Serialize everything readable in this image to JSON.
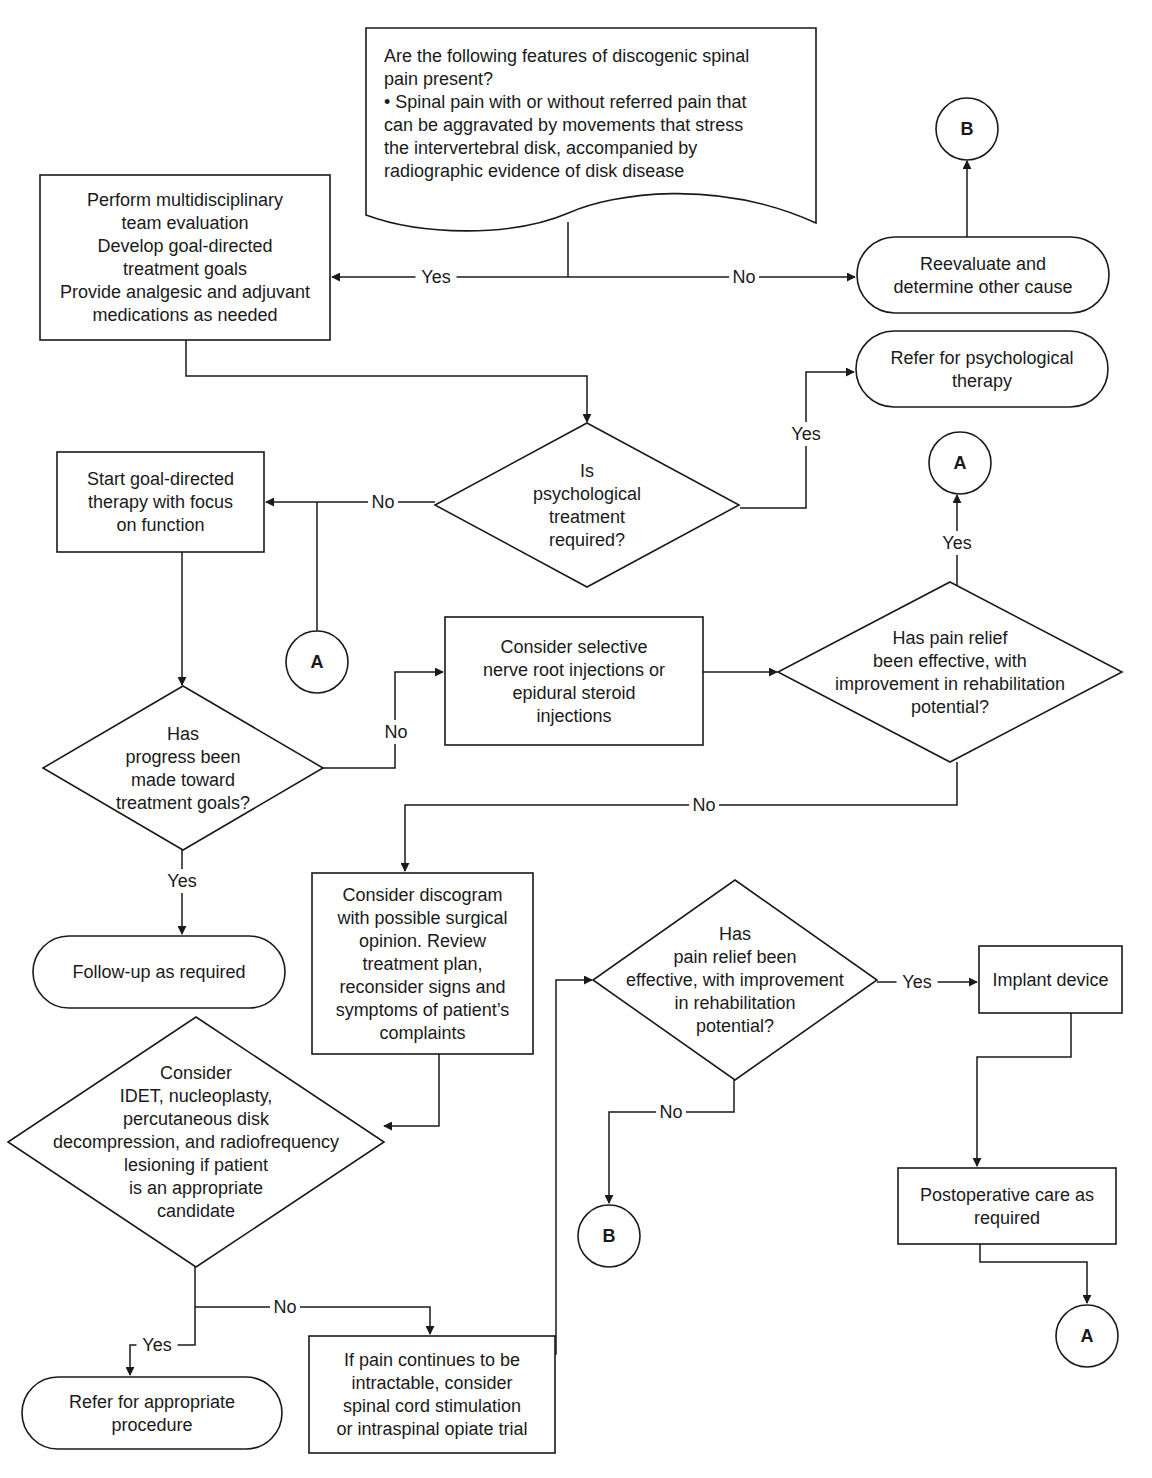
{
  "colors": {
    "line": "#1a1a1a",
    "fill": "#ffffff",
    "text": "#1a1a1a"
  },
  "nodes": [
    {
      "id": "q-discogenic",
      "type": "document",
      "x": 366,
      "y": 28,
      "w": 450,
      "h": 205,
      "align": "left",
      "text_x": 384,
      "text_y": 62,
      "lines": [
        "Are the following features of discogenic spinal",
        "pain present?",
        "• Spinal pain with or without referred pain that",
        "   can be aggravated by movements that stress",
        "   the intervertebral disk, accompanied by",
        "   radiographic evidence of disk disease"
      ]
    },
    {
      "id": "multidisciplinary-eval",
      "type": "rect",
      "x": 40,
      "y": 175,
      "w": 290,
      "h": 165,
      "lines": [
        "Perform multidisciplinary",
        "team evaluation",
        "Develop goal-directed",
        "treatment goals",
        "Provide analgesic and adjuvant",
        "medications as needed"
      ]
    },
    {
      "id": "reevaluate-other-cause",
      "type": "terminal",
      "x": 857,
      "y": 237,
      "w": 252,
      "h": 76,
      "lines": [
        "Reevaluate and",
        "determine other cause"
      ]
    },
    {
      "id": "refer-psych-therapy",
      "type": "terminal",
      "x": 856,
      "y": 331,
      "w": 252,
      "h": 76,
      "lines": [
        "Refer for psychological",
        "therapy"
      ]
    },
    {
      "id": "q-psych-treatment",
      "type": "diamond",
      "cx": 587,
      "cy": 505,
      "hw": 152,
      "hh": 82,
      "lines": [
        "Is",
        "psychological",
        "treatment",
        "required?"
      ]
    },
    {
      "id": "goal-directed-therapy",
      "type": "rect",
      "x": 57,
      "y": 452,
      "w": 207,
      "h": 100,
      "lines": [
        "Start goal-directed",
        "therapy with focus",
        "on function"
      ]
    },
    {
      "id": "q-progress",
      "type": "diamond",
      "cx": 183,
      "cy": 768,
      "hw": 140,
      "hh": 82,
      "lines": [
        "Has",
        "progress been",
        "made toward",
        "treatment goals?"
      ]
    },
    {
      "id": "nerve-root-injections",
      "type": "rect",
      "x": 445,
      "y": 617,
      "w": 258,
      "h": 128,
      "lines": [
        "Consider selective",
        "nerve root injections or",
        "epidural steroid",
        "injections"
      ]
    },
    {
      "id": "q-pain-relief-1",
      "type": "diamond",
      "cx": 950,
      "cy": 672,
      "hw": 172,
      "hh": 90,
      "lines": [
        "Has pain relief",
        "been effective, with",
        "improvement in rehabilitation",
        "potential?"
      ]
    },
    {
      "id": "followup",
      "type": "terminal",
      "x": 33,
      "y": 936,
      "w": 252,
      "h": 72,
      "lines": [
        "Follow-up as required"
      ]
    },
    {
      "id": "discogram",
      "type": "rect",
      "x": 312,
      "y": 873,
      "w": 221,
      "h": 181,
      "lines": [
        "Consider discogram",
        "with possible surgical",
        "opinion. Review",
        "treatment plan,",
        "reconsider signs and",
        "symptoms of patient’s",
        "complaints"
      ]
    },
    {
      "id": "q-idet",
      "type": "diamond",
      "cx": 196,
      "cy": 1142,
      "hw": 188,
      "hh": 125,
      "lines": [
        "Consider",
        "IDET, nucleoplasty,",
        "percutaneous disk",
        "decompression, and radiofrequency",
        "lesioning if patient",
        "is an appropriate",
        "candidate"
      ]
    },
    {
      "id": "q-pain-relief-2",
      "type": "diamond",
      "cx": 735,
      "cy": 980,
      "hw": 142,
      "hh": 100,
      "lines": [
        "Has",
        "pain relief been",
        "effective, with improvement",
        "in rehabilitation",
        "potential?"
      ]
    },
    {
      "id": "implant-device",
      "type": "rect",
      "x": 979,
      "y": 946,
      "w": 143,
      "h": 67,
      "lines": [
        "Implant device"
      ]
    },
    {
      "id": "postop-care",
      "type": "rect",
      "x": 898,
      "y": 1168,
      "w": 218,
      "h": 76,
      "lines": [
        "Postoperative care as",
        "required"
      ]
    },
    {
      "id": "refer-procedure",
      "type": "terminal",
      "x": 22,
      "y": 1377,
      "w": 260,
      "h": 72,
      "lines": [
        "Refer for appropriate",
        "procedure"
      ]
    },
    {
      "id": "scs-trial",
      "type": "rect",
      "x": 309,
      "y": 1336,
      "w": 246,
      "h": 117,
      "lines": [
        "If pain continues to be",
        "intractable, consider",
        "spinal cord stimulation",
        "or intraspinal opiate trial"
      ]
    }
  ],
  "connectors": [
    {
      "id": "connector-b-top",
      "label": "B",
      "cx": 967,
      "cy": 129,
      "r": 31
    },
    {
      "id": "connector-a-right",
      "label": "A",
      "cx": 960,
      "cy": 463,
      "r": 31
    },
    {
      "id": "connector-a-left",
      "label": "A",
      "cx": 317,
      "cy": 662,
      "r": 31
    },
    {
      "id": "connector-b-bottom",
      "label": "B",
      "cx": 609,
      "cy": 1236,
      "r": 31
    },
    {
      "id": "connector-a-bottom",
      "label": "A",
      "cx": 1087,
      "cy": 1336,
      "r": 31
    }
  ],
  "edges": [
    {
      "id": "edge-discogenic-down",
      "points": [
        [
          568,
          222
        ],
        [
          568,
          277
        ]
      ],
      "arrow": false
    },
    {
      "id": "edge-discogenic-yes",
      "points": [
        [
          568,
          277
        ],
        [
          332,
          277
        ]
      ],
      "arrow": true
    },
    {
      "id": "edge-discogenic-no",
      "points": [
        [
          568,
          277
        ],
        [
          855,
          277
        ]
      ],
      "arrow": true
    },
    {
      "id": "edge-reevaluate-to-b",
      "points": [
        [
          967,
          237
        ],
        [
          967,
          161
        ]
      ],
      "arrow": true
    },
    {
      "id": "edge-eval-to-psych",
      "points": [
        [
          186,
          340
        ],
        [
          186,
          376
        ],
        [
          587,
          376
        ],
        [
          587,
          422
        ]
      ],
      "arrow": true
    },
    {
      "id": "edge-psych-yes",
      "points": [
        [
          740,
          508
        ],
        [
          806,
          508
        ],
        [
          806,
          372
        ],
        [
          854,
          372
        ]
      ],
      "arrow": true
    },
    {
      "id": "edge-psych-no",
      "points": [
        [
          435,
          502
        ],
        [
          266,
          502
        ]
      ],
      "arrow": true
    },
    {
      "id": "edge-a-to-therapy",
      "points": [
        [
          317,
          631
        ],
        [
          317,
          502
        ]
      ],
      "arrow": false
    },
    {
      "id": "edge-therapy-to-progress",
      "points": [
        [
          182,
          552
        ],
        [
          182,
          685
        ]
      ],
      "arrow": true
    },
    {
      "id": "edge-progress-no",
      "points": [
        [
          323,
          768
        ],
        [
          395,
          768
        ],
        [
          395,
          672
        ],
        [
          443,
          672
        ]
      ],
      "arrow": true
    },
    {
      "id": "edge-injections-to-relief",
      "points": [
        [
          703,
          672
        ],
        [
          777,
          672
        ]
      ],
      "arrow": true
    },
    {
      "id": "edge-relief1-yes",
      "points": [
        [
          957,
          587
        ],
        [
          957,
          495
        ]
      ],
      "arrow": true
    },
    {
      "id": "edge-relief1-no",
      "points": [
        [
          957,
          762
        ],
        [
          957,
          805
        ],
        [
          405,
          805
        ],
        [
          405,
          871
        ]
      ],
      "arrow": true
    },
    {
      "id": "edge-progress-yes",
      "points": [
        [
          182,
          850
        ],
        [
          182,
          934
        ]
      ],
      "arrow": true
    },
    {
      "id": "edge-discogram-to-idet",
      "points": [
        [
          439,
          1054
        ],
        [
          439,
          1126
        ],
        [
          384,
          1126
        ]
      ],
      "arrow": true
    },
    {
      "id": "edge-idet-down",
      "points": [
        [
          195,
          1267
        ],
        [
          195,
          1307
        ]
      ],
      "arrow": false
    },
    {
      "id": "edge-idet-no",
      "points": [
        [
          195,
          1307
        ],
        [
          430,
          1307
        ],
        [
          430,
          1334
        ]
      ],
      "arrow": true
    },
    {
      "id": "edge-idet-yes",
      "points": [
        [
          195,
          1307
        ],
        [
          195,
          1345
        ],
        [
          130,
          1345
        ],
        [
          130,
          1375
        ]
      ],
      "arrow": true
    },
    {
      "id": "edge-scs-to-relief2",
      "points": [
        [
          555,
          1354
        ],
        [
          556,
          1354
        ],
        [
          556,
          980
        ],
        [
          592,
          980
        ]
      ],
      "arrow": true
    },
    {
      "id": "edge-relief2-yes",
      "points": [
        [
          877,
          982
        ],
        [
          977,
          982
        ]
      ],
      "arrow": true
    },
    {
      "id": "edge-relief2-no",
      "points": [
        [
          734,
          1080
        ],
        [
          734,
          1112
        ],
        [
          609,
          1112
        ],
        [
          609,
          1203
        ]
      ],
      "arrow": true
    },
    {
      "id": "edge-implant-to-postop",
      "points": [
        [
          1071,
          1013
        ],
        [
          1071,
          1057
        ],
        [
          977,
          1057
        ],
        [
          977,
          1166
        ]
      ],
      "arrow": true
    },
    {
      "id": "edge-postop-to-a",
      "points": [
        [
          980,
          1244
        ],
        [
          980,
          1262
        ],
        [
          1087,
          1262
        ],
        [
          1087,
          1303
        ]
      ],
      "arrow": true
    }
  ],
  "edge_labels": [
    {
      "id": "label-discogenic-yes",
      "text": "Yes",
      "x": 436,
      "y": 277
    },
    {
      "id": "label-discogenic-no",
      "text": "No",
      "x": 744,
      "y": 277
    },
    {
      "id": "label-psych-yes",
      "text": "Yes",
      "x": 806,
      "y": 434
    },
    {
      "id": "label-psych-no",
      "text": "No",
      "x": 383,
      "y": 502
    },
    {
      "id": "label-relief1-yes",
      "text": "Yes",
      "x": 957,
      "y": 543
    },
    {
      "id": "label-progress-no",
      "text": "No",
      "x": 396,
      "y": 732
    },
    {
      "id": "label-relief1-no",
      "text": "No",
      "x": 704,
      "y": 805
    },
    {
      "id": "label-progress-yes",
      "text": "Yes",
      "x": 182,
      "y": 881
    },
    {
      "id": "label-relief2-yes",
      "text": "Yes",
      "x": 917,
      "y": 982
    },
    {
      "id": "label-relief2-no",
      "text": "No",
      "x": 671,
      "y": 1112
    },
    {
      "id": "label-idet-no",
      "text": "No",
      "x": 285,
      "y": 1307
    },
    {
      "id": "label-idet-yes",
      "text": "Yes",
      "x": 157,
      "y": 1345
    }
  ]
}
